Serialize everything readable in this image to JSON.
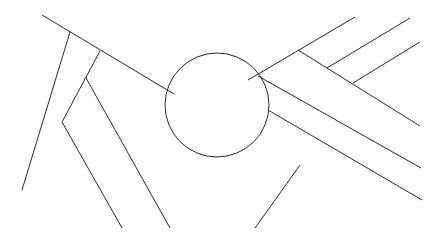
{
  "diagram": {
    "type": "mind-map",
    "center": {
      "lines": [
        "DRIVING",
        "UNDER THE",
        "INFLUENCE",
        "OF ALCOHOL"
      ]
    },
    "branches": [
      {
        "label": "Vision blurred",
        "children": [
          {
            "label_lines": [
              "can't see",
              "traffic lights"
            ]
          },
          {
            "label_lines": [
              "don't notice objects",
              "in peripheral vision"
            ]
          },
          {
            "label": "approaching cars"
          },
          {
            "label": "people on crosswalks"
          }
        ]
      },
      {
        "label": "Judgment impaired",
        "children": [
          {
            "label": "go too fast",
            "children": [
              {
                "label": "on freeways"
              },
              {
                "label": "in school zones"
              }
            ]
          },
          {
            "label": "swerve out of lane"
          }
        ]
      },
      {
        "label": "Reflexes slow",
        "children": [
          {
            "label_lines": [
              "slide through",
              "stop signs"
            ]
          },
          {
            "label_lines": [
              "can't stop",
              "in emergency"
            ]
          },
          {
            "label_lines": [
              "kids on",
              "street"
            ]
          }
        ]
      }
    ]
  },
  "colors": {
    "line": "#2a2a2a",
    "text": "#1a1a1a",
    "background": "#ffffff"
  }
}
